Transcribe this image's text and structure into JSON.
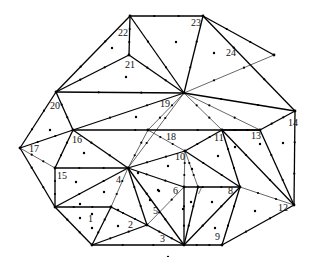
{
  "diagram": {
    "type": "triangulated-mesh",
    "vertices": {
      "A": [
        130,
        16
      ],
      "B": [
        203,
        16
      ],
      "C": [
        129,
        55
      ],
      "D": [
        56,
        92
      ],
      "E": [
        184,
        93
      ],
      "F": [
        295,
        111
      ],
      "G": [
        20,
        148
      ],
      "H": [
        73,
        130
      ],
      "I": [
        55,
        168
      ],
      "J": [
        128,
        168
      ],
      "K": [
        55,
        207
      ],
      "L": [
        92,
        245
      ],
      "M": [
        184,
        245
      ],
      "N": [
        222,
        245
      ],
      "O": [
        294,
        205
      ],
      "P": [
        240,
        187
      ],
      "Q": [
        184,
        187
      ],
      "R": [
        185,
        151
      ],
      "S": [
        222,
        130
      ],
      "T": [
        260,
        130
      ],
      "U": [
        148,
        130
      ],
      "V": [
        111,
        207
      ],
      "W": [
        147,
        225
      ],
      "X": [
        198,
        187
      ],
      "Y": [
        274,
        55
      ]
    },
    "edges": [
      {
        "from": "A",
        "to": "B",
        "w": "thick"
      },
      {
        "from": "A",
        "to": "C",
        "w": "thick"
      },
      {
        "from": "A",
        "to": "D",
        "w": "thick"
      },
      {
        "from": "A",
        "to": "E",
        "w": "thick"
      },
      {
        "from": "B",
        "to": "E",
        "w": "thick"
      },
      {
        "from": "B",
        "to": "F",
        "w": "thick"
      },
      {
        "from": "C",
        "to": "D",
        "w": "thick"
      },
      {
        "from": "C",
        "to": "E",
        "w": "thick"
      },
      {
        "from": "D",
        "to": "E",
        "w": "thick"
      },
      {
        "from": "D",
        "to": "G",
        "w": "thick"
      },
      {
        "from": "D",
        "to": "H",
        "w": "thick"
      },
      {
        "from": "E",
        "to": "Y",
        "w": "thin"
      },
      {
        "from": "E",
        "to": "F",
        "w": "thick"
      },
      {
        "from": "E",
        "to": "H",
        "w": "thick"
      },
      {
        "from": "E",
        "to": "U",
        "w": "thin"
      },
      {
        "from": "E",
        "to": "S",
        "w": "thin"
      },
      {
        "from": "E",
        "to": "T",
        "w": "thin"
      },
      {
        "from": "G",
        "to": "H",
        "w": "thick"
      },
      {
        "from": "G",
        "to": "I",
        "w": "thin"
      },
      {
        "from": "G",
        "to": "K",
        "w": "thick"
      },
      {
        "from": "H",
        "to": "I",
        "w": "thick"
      },
      {
        "from": "H",
        "to": "J",
        "w": "thick"
      },
      {
        "from": "H",
        "to": "T",
        "w": "thick"
      },
      {
        "from": "I",
        "to": "J",
        "w": "thick"
      },
      {
        "from": "I",
        "to": "K",
        "w": "thick"
      },
      {
        "from": "K",
        "to": "J",
        "w": "thick"
      },
      {
        "from": "K",
        "to": "L",
        "w": "thick"
      },
      {
        "from": "K",
        "to": "V",
        "w": "thick"
      },
      {
        "from": "V",
        "to": "J",
        "w": "thin"
      },
      {
        "from": "V",
        "to": "L",
        "w": "thick"
      },
      {
        "from": "V",
        "to": "W",
        "w": "thick"
      },
      {
        "from": "L",
        "to": "W",
        "w": "thick"
      },
      {
        "from": "L",
        "to": "M",
        "w": "thick"
      },
      {
        "from": "W",
        "to": "M",
        "w": "thick"
      },
      {
        "from": "W",
        "to": "J",
        "w": "thick"
      },
      {
        "from": "W",
        "to": "Q",
        "w": "thin"
      },
      {
        "from": "J",
        "to": "M",
        "w": "thick"
      },
      {
        "from": "J",
        "to": "Q",
        "w": "thick"
      },
      {
        "from": "J",
        "to": "R",
        "w": "thick"
      },
      {
        "from": "J",
        "to": "U",
        "w": "thin"
      },
      {
        "from": "J",
        "to": "E",
        "w": "thin"
      },
      {
        "from": "U",
        "to": "R",
        "w": "thin"
      },
      {
        "from": "R",
        "to": "S",
        "w": "thick"
      },
      {
        "from": "R",
        "to": "Q",
        "w": "thin"
      },
      {
        "from": "R",
        "to": "X",
        "w": "thin"
      },
      {
        "from": "R",
        "to": "P",
        "w": "thick"
      },
      {
        "from": "Q",
        "to": "M",
        "w": "thick"
      },
      {
        "from": "Q",
        "to": "P",
        "w": "thick"
      },
      {
        "from": "X",
        "to": "M",
        "w": "thick"
      },
      {
        "from": "M",
        "to": "N",
        "w": "thick"
      },
      {
        "from": "M",
        "to": "P",
        "w": "thick"
      },
      {
        "from": "N",
        "to": "P",
        "w": "thick"
      },
      {
        "from": "N",
        "to": "O",
        "w": "thick"
      },
      {
        "from": "S",
        "to": "P",
        "w": "thick"
      },
      {
        "from": "S",
        "to": "O",
        "w": "thick"
      },
      {
        "from": "S",
        "to": "T",
        "w": "thick"
      },
      {
        "from": "T",
        "to": "F",
        "w": "thick"
      },
      {
        "from": "T",
        "to": "O",
        "w": "thick"
      },
      {
        "from": "P",
        "to": "O",
        "w": "thin"
      },
      {
        "from": "F",
        "to": "O",
        "w": "thick"
      },
      {
        "from": "B",
        "to": "Y",
        "w": "thick"
      }
    ],
    "labels": [
      {
        "text": "1",
        "x": 88,
        "y": 222
      },
      {
        "text": "2",
        "x": 128,
        "y": 228
      },
      {
        "text": "3",
        "x": 160,
        "y": 242
      },
      {
        "text": "4",
        "x": 116,
        "y": 183
      },
      {
        "text": "5",
        "x": 153,
        "y": 214
      },
      {
        "text": "6",
        "x": 173,
        "y": 194
      },
      {
        "text": "7",
        "x": 197,
        "y": 194
      },
      {
        "text": "8",
        "x": 228,
        "y": 194
      },
      {
        "text": "9",
        "x": 215,
        "y": 240
      },
      {
        "text": "10",
        "x": 175,
        "y": 160
      },
      {
        "text": "11",
        "x": 214,
        "y": 141
      },
      {
        "text": "12",
        "x": 278,
        "y": 211
      },
      {
        "text": "13",
        "x": 251,
        "y": 139
      },
      {
        "text": "14",
        "x": 288,
        "y": 126
      },
      {
        "text": "15",
        "x": 57,
        "y": 179
      },
      {
        "text": "16",
        "x": 72,
        "y": 143
      },
      {
        "text": "17",
        "x": 29,
        "y": 152
      },
      {
        "text": "18",
        "x": 166,
        "y": 140
      },
      {
        "text": "19",
        "x": 160,
        "y": 107
      },
      {
        "text": "20",
        "x": 50,
        "y": 109
      },
      {
        "text": "21",
        "x": 125,
        "y": 68
      },
      {
        "text": "22",
        "x": 118,
        "y": 36
      },
      {
        "text": "23",
        "x": 191,
        "y": 26
      },
      {
        "text": "24",
        "x": 226,
        "y": 56
      }
    ],
    "interior_points": [
      [
        112,
        48
      ],
      [
        126,
        77
      ],
      [
        50,
        130
      ],
      [
        136,
        117
      ],
      [
        176,
        42
      ],
      [
        214,
        53
      ],
      [
        84,
        153
      ],
      [
        76,
        182
      ],
      [
        104,
        192
      ],
      [
        80,
        218
      ],
      [
        92,
        214
      ],
      [
        92,
        228
      ],
      [
        118,
        226
      ],
      [
        80,
        204
      ],
      [
        138,
        173
      ],
      [
        158,
        190
      ],
      [
        150,
        200
      ],
      [
        168,
        166
      ],
      [
        192,
        169
      ],
      [
        218,
        156
      ],
      [
        260,
        144
      ],
      [
        283,
        143
      ],
      [
        159,
        191
      ],
      [
        191,
        202
      ],
      [
        212,
        202
      ],
      [
        215,
        228
      ],
      [
        255,
        211
      ],
      [
        168,
        257
      ],
      [
        118,
        210
      ],
      [
        183,
        209
      ],
      [
        235,
        147
      ]
    ]
  }
}
